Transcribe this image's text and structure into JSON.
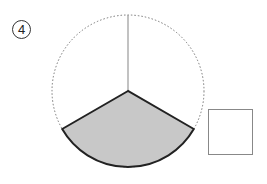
{
  "problem": {
    "number_label": "4"
  },
  "figure": {
    "shape": "circle",
    "center": [
      128,
      91
    ],
    "radius": 76,
    "outline_style": "dotted",
    "shaded_sector": {
      "start_angle_deg": 210,
      "end_angle_deg": 330,
      "fraction": "1/3",
      "fill": "#c8c8c8",
      "stroke": "#222222"
    },
    "radius_line_to_top": true
  },
  "answer_box": {
    "value": ""
  }
}
